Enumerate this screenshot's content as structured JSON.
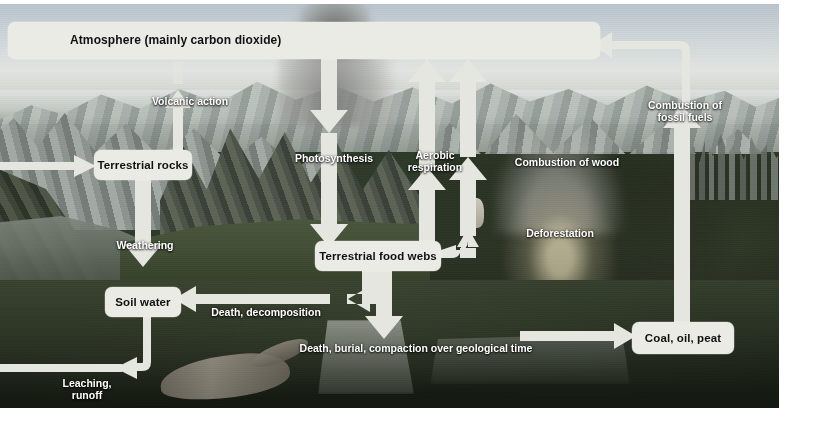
{
  "diagram": {
    "type": "flow-diagram",
    "style": {
      "box_fill": "#ebebe6",
      "box_text": "#111111",
      "arrow_fill": "#e6e6e0",
      "label_text": "#ffffff",
      "page_background": "#ffffff"
    },
    "nodes": [
      {
        "id": "atmosphere",
        "label": "Atmosphere (mainly carbon dioxide)",
        "x": 8,
        "y": 22,
        "w": 592,
        "h": 37,
        "align": "left"
      },
      {
        "id": "rocks",
        "label": "Terrestrial rocks",
        "x": 94,
        "y": 150,
        "w": 98,
        "h": 30,
        "align": "center"
      },
      {
        "id": "soil",
        "label": "Soil water",
        "x": 105,
        "y": 287,
        "w": 76,
        "h": 30,
        "align": "center"
      },
      {
        "id": "foodwebs",
        "label": "Terrestrial food webs",
        "x": 315,
        "y": 241,
        "w": 126,
        "h": 30,
        "align": "center"
      },
      {
        "id": "fossil",
        "label": "Coal, oil, peat",
        "x": 632,
        "y": 322,
        "w": 102,
        "h": 32,
        "align": "center"
      }
    ],
    "flows": [
      {
        "id": "volcanic",
        "label": "Volcanic action",
        "from": "terrestrial-rocks",
        "to": "atmosphere",
        "x": 145,
        "y": 83,
        "w": 90,
        "align": "center"
      },
      {
        "id": "photosynthesis",
        "label": "Photosynthesis",
        "from": "atmosphere",
        "to": "food-webs",
        "x": 290,
        "y": 140,
        "w": 96,
        "align": "center"
      },
      {
        "id": "aerobic",
        "label": "Aerobic\nrespiration",
        "from": "food-webs",
        "to": "atmosphere",
        "x": 398,
        "y": 138,
        "w": 76,
        "align": "center"
      },
      {
        "id": "wood",
        "label": "Combustion of wood",
        "from": "deforestation",
        "to": "atmosphere",
        "x": 505,
        "y": 144,
        "w": 126,
        "align": "center"
      },
      {
        "id": "fossilfuels",
        "label": "Combustion of\nfossil fuels",
        "from": "coal-oil-peat",
        "to": "atmosphere",
        "x": 636,
        "y": 88,
        "w": 96,
        "align": "center"
      },
      {
        "id": "weathering",
        "label": "Weathering",
        "from": "terrestrial-rocks",
        "to": "soil-water",
        "x": 108,
        "y": 228,
        "w": 80,
        "align": "center"
      },
      {
        "id": "deforestation",
        "label": "Deforestation",
        "from": "food-webs",
        "to": "combustion-of-wood",
        "x": 517,
        "y": 215,
        "w": 88,
        "align": "center"
      },
      {
        "id": "decomposition",
        "label": "Death, decomposition",
        "from": "food-webs",
        "to": "soil-water",
        "x": 209,
        "y": 295,
        "w": 118,
        "align": "center"
      },
      {
        "id": "burial",
        "label": "Death, burial, compaction over geological time",
        "from": "food-webs",
        "to": "coal-oil-peat",
        "x": 300,
        "y": 330,
        "w": 230,
        "align": "center"
      },
      {
        "id": "leaching",
        "label": "Leaching,\nrunoff",
        "from": "soil-water",
        "to": "ocean",
        "x": 56,
        "y": 366,
        "w": 64,
        "align": "center"
      }
    ]
  }
}
